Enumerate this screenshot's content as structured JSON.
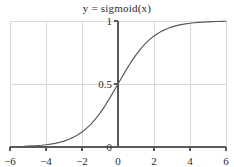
{
  "chart_data": {
    "type": "line",
    "title": "y = sigmoid(x)",
    "xlabel": "",
    "ylabel": "",
    "xlim": [
      -6,
      6
    ],
    "ylim": [
      0,
      1
    ],
    "grid": true,
    "legend": "none",
    "x_ticks": [
      "−6",
      "−4",
      "−2",
      "0",
      "2",
      "4",
      "6"
    ],
    "x_tick_values": [
      -6,
      -4,
      -2,
      0,
      2,
      4,
      6
    ],
    "y_ticks": [
      "0",
      "0.5",
      "1"
    ],
    "y_tick_values": [
      0,
      0.5,
      1
    ],
    "series": [
      {
        "name": "sigmoid",
        "color": "#595959",
        "x": [
          -6,
          -5.75,
          -5.5,
          -5.25,
          -5,
          -4.75,
          -4.5,
          -4.25,
          -4,
          -3.75,
          -3.5,
          -3.25,
          -3,
          -2.75,
          -2.5,
          -2.25,
          -2,
          -1.75,
          -1.5,
          -1.25,
          -1,
          -0.75,
          -0.5,
          -0.25,
          0,
          0.25,
          0.5,
          0.75,
          1,
          1.25,
          1.5,
          1.75,
          2,
          2.25,
          2.5,
          2.75,
          3,
          3.25,
          3.5,
          3.75,
          4,
          4.25,
          4.5,
          4.75,
          5,
          5.25,
          5.5,
          5.75,
          6
        ],
        "y": [
          0.002,
          0.003,
          0.004,
          0.005,
          0.007,
          0.009,
          0.011,
          0.014,
          0.018,
          0.023,
          0.029,
          0.037,
          0.047,
          0.06,
          0.076,
          0.095,
          0.119,
          0.148,
          0.182,
          0.223,
          0.269,
          0.321,
          0.378,
          0.438,
          0.5,
          0.562,
          0.622,
          0.679,
          0.731,
          0.777,
          0.818,
          0.852,
          0.881,
          0.905,
          0.924,
          0.94,
          0.953,
          0.963,
          0.971,
          0.977,
          0.982,
          0.986,
          0.989,
          0.991,
          0.993,
          0.995,
          0.996,
          0.997,
          0.998
        ]
      }
    ]
  },
  "style": {
    "grid_color": "#d8d8d8",
    "axis_color": "#5a5a5a",
    "curve_color": "#5a5a5a",
    "background": "#ffffff",
    "text_color": "#2b2b2b"
  }
}
